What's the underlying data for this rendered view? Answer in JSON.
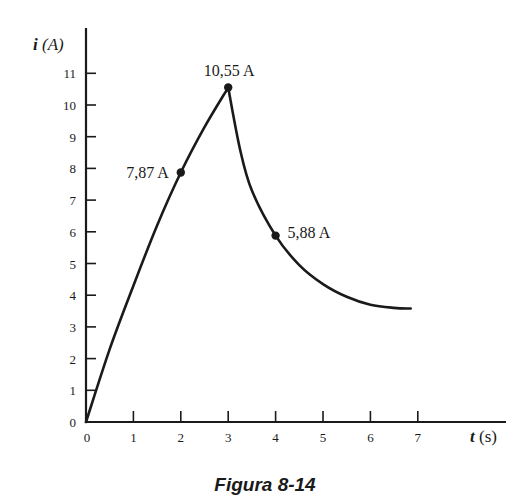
{
  "chart_data": {
    "type": "line",
    "title": "",
    "caption": "Figura 8-14",
    "xlabel": "t (s)",
    "ylabel": "i (A)",
    "xlim": [
      0,
      7.5
    ],
    "ylim": [
      0,
      11.5
    ],
    "x_ticks": [
      0,
      1,
      2,
      3,
      4,
      5,
      6,
      7
    ],
    "y_ticks": [
      0,
      1,
      2,
      3,
      4,
      5,
      6,
      7,
      8,
      9,
      10,
      11
    ],
    "grid": false,
    "legend": null,
    "series": [
      {
        "name": "rise",
        "description": "charging phase, 0 <= t <= 3",
        "x": [
          0,
          0.5,
          1,
          1.5,
          2,
          2.5,
          3
        ],
        "values": [
          0,
          2.3,
          4.3,
          6.2,
          7.87,
          9.3,
          10.55
        ]
      },
      {
        "name": "decay",
        "description": "discharging phase, 3 <= t <= 6.85",
        "x": [
          3,
          3.25,
          3.5,
          4,
          4.5,
          5,
          5.5,
          6,
          6.5,
          6.85
        ],
        "values": [
          10.55,
          8.6,
          7.3,
          5.88,
          4.95,
          4.35,
          3.95,
          3.7,
          3.6,
          3.58
        ]
      }
    ],
    "annotations": [
      {
        "x": 2,
        "y": 7.87,
        "label": "7,87 A",
        "position": "left"
      },
      {
        "x": 3,
        "y": 10.55,
        "label": "10,55 A",
        "position": "above"
      },
      {
        "x": 4,
        "y": 5.88,
        "label": "5,88 A",
        "position": "right"
      }
    ]
  },
  "labels": {
    "x_axis_t": "t",
    "x_axis_unit": "(s)",
    "y_axis_i": "i",
    "y_axis_unit": "(A)",
    "caption": "Figura 8-14"
  },
  "colors": {
    "ink": "#1a1a1a",
    "background": "#ffffff"
  }
}
